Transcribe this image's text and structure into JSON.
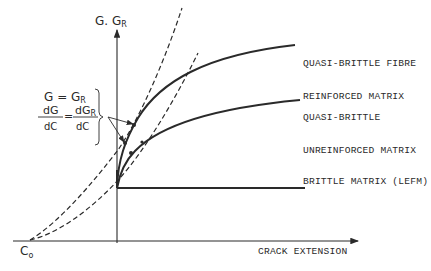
{
  "diagram": {
    "type": "resistance-curve schematic",
    "axes": {
      "y_label": "G. G",
      "y_label_sub": "R",
      "x_label": "CRACK EXTENSION",
      "origin_label": "C",
      "origin_label_sub": "o"
    },
    "curves": [
      {
        "id": "fibre",
        "label_line1": "QUASI-BRITTLE FIBRE",
        "label_line2": "REINFORCED MATRIX",
        "style": "solid"
      },
      {
        "id": "unreinforced",
        "label_line1": "QUASI-BRITTLE",
        "label_line2": "UNREINFORCED MATRIX",
        "style": "solid"
      },
      {
        "id": "brittle",
        "label_line1": "BRITTLE MATRIX (LEFM)",
        "style": "solid"
      }
    ],
    "dashed_lines": [
      {
        "id": "driving-force-1",
        "style": "dashed",
        "from": "C0"
      },
      {
        "id": "driving-force-2",
        "style": "dashed",
        "from": "C0"
      }
    ],
    "condition": {
      "line1_lhs": "G",
      "line1_eq": "=",
      "line1_rhs": "G",
      "line1_rhs_sub": "R",
      "frac1_num": "dG",
      "frac1_den": "dC",
      "eq": "=",
      "frac2_num": "dG",
      "frac2_num_sub": "R",
      "frac2_den": "dC"
    },
    "colors": {
      "ink": "#2a2a2a",
      "background": "#ffffff"
    }
  }
}
